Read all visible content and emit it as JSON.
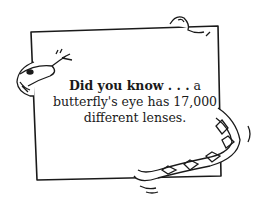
{
  "sign": {
    "lead": "Did you know . . .",
    "line1_rest": " a",
    "line2": "butterfly's eye has 17,000",
    "line3": "different lenses."
  },
  "colors": {
    "ink": "#1a1a1a",
    "paper": "#ffffff"
  }
}
